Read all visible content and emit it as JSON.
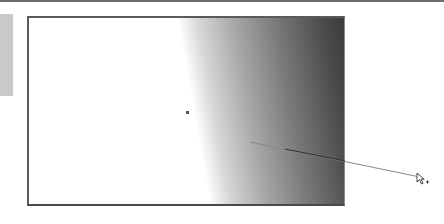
{
  "app": {
    "view": "image-canvas",
    "active_tool": "gradient-tool"
  },
  "canvas": {
    "gradient": {
      "type": "linear",
      "start_color": "#ffffff",
      "end_color": "#3c3c3c"
    },
    "border_color": "#5a5a5a"
  },
  "gradient_drag": {
    "start": {
      "x": 250,
      "y": 142
    },
    "end": {
      "x": 420,
      "y": 177
    },
    "line_color": "#7a7a7a"
  },
  "cursor": {
    "icon": "arrow-plus-cursor-icon",
    "x": 420,
    "y": 177
  },
  "colors": {
    "side_panel": "#c9c9c9",
    "top_rule": "#6e6e6e"
  }
}
